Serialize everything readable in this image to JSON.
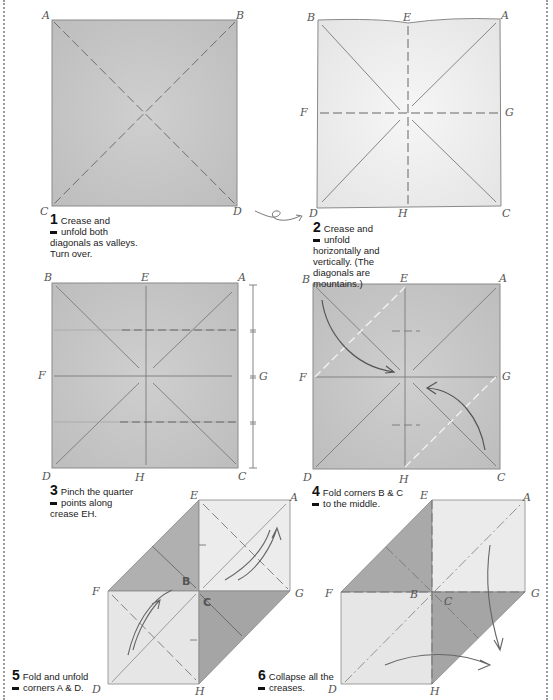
{
  "steps": [
    {
      "num": "1",
      "text_line1": "Crease and",
      "text_line2": "unfold both",
      "text_rest": [
        "diagonals as valleys.",
        "Turn over."
      ],
      "labels": {
        "tl": "A",
        "tr": "B",
        "bl": "C",
        "br": "D"
      }
    },
    {
      "num": "2",
      "text_line1": "Crease and",
      "text_line2": "unfold",
      "text_rest": [
        "horizontally and",
        "vertically. (The",
        "diagonals are",
        "mountains.)"
      ],
      "labels": {
        "tl": "B",
        "top": "E",
        "tr": "A",
        "left": "F",
        "right": "G",
        "bl": "D",
        "bottom": "H",
        "br": "C"
      }
    },
    {
      "num": "3",
      "text_line1": "Pinch the quarter",
      "text_line2": "points along",
      "text_rest": [
        "crease EH."
      ],
      "labels": {
        "tl": "B",
        "top": "E",
        "tr": "A",
        "left": "F",
        "right": "G",
        "bl": "D",
        "bottom": "H",
        "br": "C"
      }
    },
    {
      "num": "4",
      "text_line1": "Fold corners B & C",
      "text_line2": "to the middle.",
      "text_rest": [],
      "labels": {
        "tl": "B",
        "top": "E",
        "tr": "A",
        "left": "F",
        "right": "G",
        "bl": "D",
        "bottom": "H",
        "br": "C"
      }
    },
    {
      "num": "5",
      "text_line1": "Fold and unfold",
      "text_line2": "corners A & D.",
      "text_rest": [],
      "labels": {
        "top": "E",
        "tr": "A",
        "left": "F",
        "right": "G",
        "bl": "D",
        "bottom": "H",
        "b": "B",
        "c": "C"
      }
    },
    {
      "num": "6",
      "text_line1": "Collapse all the",
      "text_line2": "creases.",
      "text_rest": [],
      "labels": {
        "top": "E",
        "tr": "A",
        "left": "F",
        "right": "G",
        "bl": "D",
        "bottom": "H",
        "b": "B",
        "c": "C"
      }
    }
  ],
  "colors": {
    "paper_dark": "#c9c9c9",
    "paper_light": "#e9e9e9",
    "paper_shade": "#a8a8a8",
    "line": "#6e6e6e"
  }
}
